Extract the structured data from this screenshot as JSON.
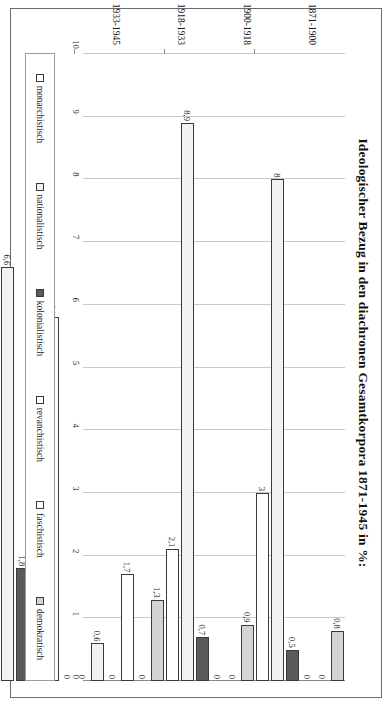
{
  "chart_data": {
    "type": "bar",
    "orientation": "horizontal",
    "title": "Ideologischer Bezug in den diachronen Gesamtkorpora 1871-1945 in %:",
    "xlabel": "",
    "ylabel": "",
    "xlim": [
      0,
      10
    ],
    "grid": true,
    "legend_position": "bottom",
    "axis_ticks": [
      "10",
      "9",
      "8",
      "7",
      "6",
      "5",
      "4",
      "3",
      "2",
      "1",
      "0"
    ],
    "categories": [
      "1871-1900",
      "1900-1918",
      "1918-1933",
      "1933-1945"
    ],
    "series": [
      {
        "name": "monarchistisch",
        "color": "#ffffff",
        "values": [
          3,
          2.1,
          0,
          0.3
        ]
      },
      {
        "name": "nationalistisch",
        "color": "#f2f2f2",
        "values": [
          8,
          8.9,
          0.6,
          6.6
        ]
      },
      {
        "name": "kolonialistisch",
        "color": "#5a5a5a",
        "values": [
          0.5,
          0.7,
          0,
          1.8
        ]
      },
      {
        "name": "revanchistisch",
        "color": "#ffffff",
        "values": [
          0,
          0,
          1.7,
          4.5
        ]
      },
      {
        "name": "faschistisch",
        "color": "#ffffff",
        "values": [
          0,
          0,
          0,
          5.8
        ]
      },
      {
        "name": "demokratisch",
        "color": "#d4d4d4",
        "values": [
          0.8,
          0.9,
          1.3,
          0
        ]
      }
    ],
    "value_labels": {
      "1871-1900": [
        "3",
        "8",
        "0,5",
        "0",
        "0",
        "0,8"
      ],
      "1900-1918": [
        "2,1",
        "8,9",
        "0,7",
        "0",
        "0",
        "0,9"
      ],
      "1918-1933": [
        "0",
        "0,6",
        "0",
        "1,7",
        "0",
        "1,3"
      ],
      "1933-1945": [
        "0,3",
        "6,6",
        "1,8",
        "4,5",
        "5,8",
        "0"
      ]
    }
  }
}
